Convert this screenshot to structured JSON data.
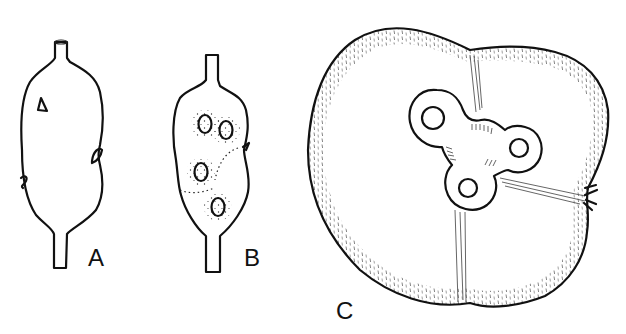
{
  "figure": {
    "type": "botanical line drawing",
    "background": "#ffffff",
    "ink_color": "#111111",
    "panels": [
      {
        "label": "A",
        "description": "Elongated stippled ovary with stalks at top and bottom and small scale-like appendages"
      },
      {
        "label": "B",
        "description": "Longitudinal section showing four ovules surrounded by dotted halos"
      },
      {
        "label": "C",
        "description": "Transverse section, three-lobed with central trilobed cavity containing three locules"
      }
    ]
  }
}
